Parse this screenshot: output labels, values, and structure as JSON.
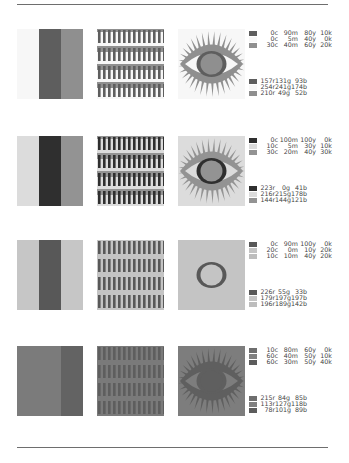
{
  "rules": {
    "top_y": 4,
    "bottom_y": 447,
    "color": "#6e6e6e"
  },
  "specimens": [
    {
      "id": "specimen-1",
      "colors": [
        "#5e5e5e",
        "#f7f7f7",
        "#8f8f8f"
      ],
      "stripes": [
        "#f7f7f7",
        "#5e5e5e",
        "#8f8f8f"
      ],
      "pattern": {
        "bg": "#f7f7f7",
        "bar": "#5e5e5e",
        "band": "#8f8f8f"
      },
      "eye": {
        "bg": "#f7f7f7",
        "shape": "#8f8f8f",
        "white": "#f7f7f7",
        "iris_ring": "#5e5e5e",
        "iris": "#8f8f8f",
        "lashes": true
      },
      "cmyk": [
        {
          "c": "0c",
          "m": "90m",
          "y": "80y",
          "k": "10k"
        },
        {
          "c": "0c",
          "m": "5m",
          "y": "40y",
          "k": "0k"
        },
        {
          "c": "30c",
          "m": "40m",
          "y": "60y",
          "k": "20k"
        }
      ],
      "rgb": [
        {
          "r": "157r",
          "g": "131g",
          "b": "93b"
        },
        {
          "r": "254r",
          "g": "241g",
          "b": "174b"
        },
        {
          "r": "210r",
          "g": "49g",
          "b": "52b"
        }
      ]
    },
    {
      "id": "specimen-2",
      "colors": [
        "#2f2f2f",
        "#dcdcdc",
        "#939393"
      ],
      "stripes": [
        "#dcdcdc",
        "#2f2f2f",
        "#939393"
      ],
      "pattern": {
        "bg": "#dcdcdc",
        "bar": "#2f2f2f",
        "band": "#939393"
      },
      "eye": {
        "bg": "#dcdcdc",
        "shape": "#939393",
        "white": "#dcdcdc",
        "iris_ring": "#2f2f2f",
        "iris": "#939393",
        "lashes": true
      },
      "cmyk": [
        {
          "c": "0c",
          "m": "100m",
          "y": "100y",
          "k": "0k"
        },
        {
          "c": "10c",
          "m": "5m",
          "y": "30y",
          "k": "10k"
        },
        {
          "c": "30c",
          "m": "20m",
          "y": "40y",
          "k": "30k"
        }
      ],
      "rgb": [
        {
          "r": "223r",
          "g": "0g",
          "b": "41b"
        },
        {
          "r": "216r",
          "g": "215g",
          "b": "178b"
        },
        {
          "r": "144r",
          "g": "144g",
          "b": "121b"
        }
      ]
    },
    {
      "id": "specimen-3",
      "colors": [
        "#585858",
        "#c4c4c4",
        "#bdbdbd"
      ],
      "stripes": [
        "#c6c6c6",
        "#585858",
        "#c6c6c6"
      ],
      "pattern": {
        "bg": "#c4c4c4",
        "bar": "#585858",
        "band": "#c4c4c4"
      },
      "eye": {
        "bg": "#c4c4c4",
        "shape": "#c1c1c1",
        "white": "#c4c4c4",
        "iris_ring": "#585858",
        "iris": "#c4c4c4",
        "lashes": false
      },
      "cmyk": [
        {
          "c": "0c",
          "m": "90m",
          "y": "100y",
          "k": "0k"
        },
        {
          "c": "20c",
          "m": "0m",
          "y": "10y",
          "k": "20k"
        },
        {
          "c": "10c",
          "m": "10m",
          "y": "40y",
          "k": "20k"
        }
      ],
      "rgb": [
        {
          "r": "226r",
          "g": "55g",
          "b": "33b"
        },
        {
          "r": "179r",
          "g": "197g",
          "b": "197b"
        },
        {
          "r": "196r",
          "g": "189g",
          "b": "142b"
        }
      ]
    },
    {
      "id": "specimen-4",
      "colors": [
        "#6e6e6e",
        "#808080",
        "#5c5c5c"
      ],
      "stripes": [
        "#7b7b7b",
        "#7b7b7b",
        "#636363"
      ],
      "pattern": {
        "bg": "#7a7a7a",
        "bar": "#5e5e5e",
        "band": "#7a7a7a"
      },
      "eye": {
        "bg": "#7d7d7d",
        "shape": "#5f5f5f",
        "white": "#7d7d7d",
        "iris_ring": "#5f5f5f",
        "iris": "#5f5f5f",
        "lashes": true
      },
      "cmyk": [
        {
          "c": "10c",
          "m": "80m",
          "y": "60y",
          "k": "0k"
        },
        {
          "c": "60c",
          "m": "40m",
          "y": "50y",
          "k": "10k"
        },
        {
          "c": "60c",
          "m": "30m",
          "y": "50y",
          "k": "40k"
        }
      ],
      "rgb": [
        {
          "r": "215r",
          "g": "84g",
          "b": "85b"
        },
        {
          "r": "113r",
          "g": "127g",
          "b": "118b"
        },
        {
          "r": "78r",
          "g": "101g",
          "b": "89b"
        }
      ]
    }
  ]
}
